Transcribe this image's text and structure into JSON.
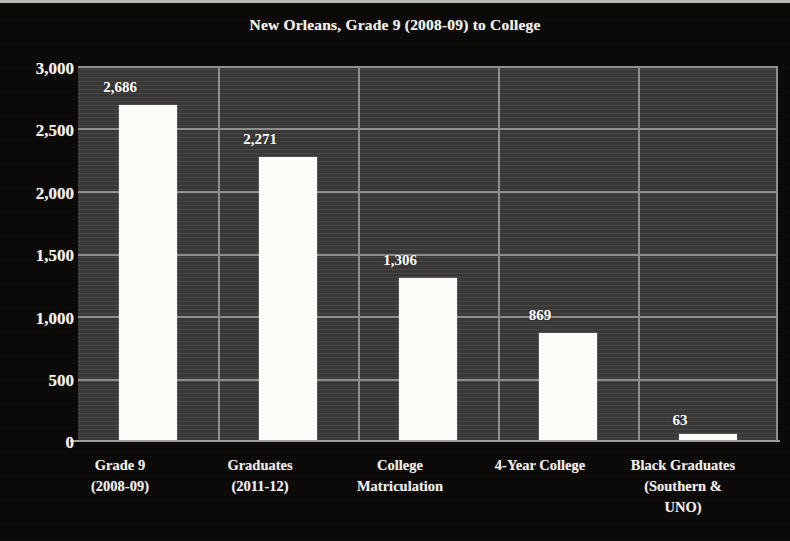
{
  "chart_data": {
    "type": "bar",
    "title": "New Orleans, Grade 9 (2008-09) to College",
    "xlabel": "",
    "ylabel": "",
    "ylim": [
      0,
      3000
    ],
    "ytick_values": [
      3000,
      2500,
      2000,
      1500,
      1000,
      500,
      0
    ],
    "ytick_labels": [
      "3,000",
      "2,500",
      "2,000",
      "1,500",
      "1,000",
      "500",
      "0"
    ],
    "grid": true,
    "legend": null,
    "categories": [
      "Grade 9 (2008-09)",
      "Graduates (2011-12)",
      "College Matriculation",
      "4-Year College",
      "Black Graduates (Southern & UNO)"
    ],
    "category_label_lines": [
      [
        "Grade 9",
        "(2008-09)"
      ],
      [
        "Graduates",
        "(2011-12)"
      ],
      [
        "College",
        "Matriculation"
      ],
      [
        "4-Year College"
      ],
      [
        "Black Graduates",
        "(Southern &",
        "UNO)"
      ]
    ],
    "values": [
      2686,
      2271,
      1306,
      869,
      63
    ],
    "value_labels": [
      "2,686",
      "2,271",
      "1,306",
      "869",
      "63"
    ],
    "colors": {
      "bar": "#fbfbf8",
      "plot_background": "#3c3b39",
      "figure_background": "#0a0908",
      "gridline": "#8f8e8a",
      "text": "#f2f0ec"
    }
  }
}
